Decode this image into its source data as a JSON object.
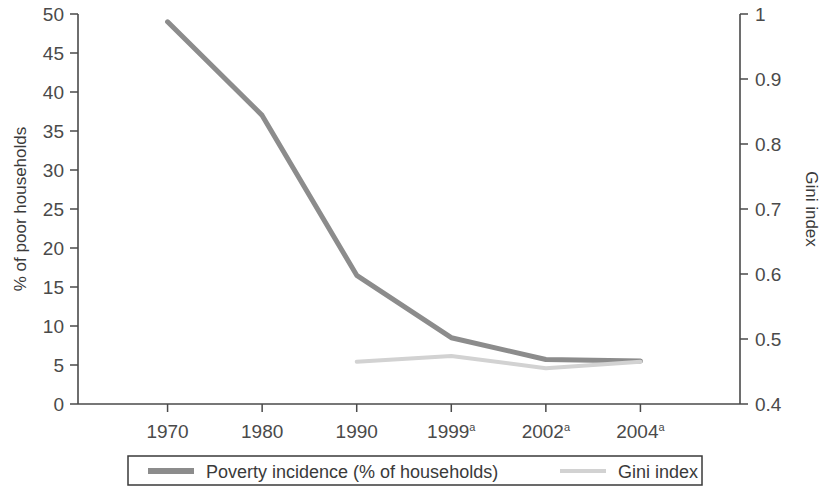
{
  "chart_data": {
    "type": "line",
    "title": "",
    "xlabel": "",
    "ylabel": "% of poor households",
    "y2label": "Gini index",
    "categories": [
      "1970",
      "1980",
      "1990",
      "1999a",
      "2002a",
      "2004a"
    ],
    "tick_labels": [
      {
        "text": "1970",
        "sup": ""
      },
      {
        "text": "1980",
        "sup": ""
      },
      {
        "text": "1990",
        "sup": ""
      },
      {
        "text": "1999",
        "sup": "a"
      },
      {
        "text": "2002",
        "sup": "a"
      },
      {
        "text": "2004",
        "sup": "a"
      }
    ],
    "ylim": [
      0,
      50
    ],
    "ylim_right": [
      0.4,
      1
    ],
    "yticks": [
      0,
      5,
      10,
      15,
      20,
      25,
      30,
      35,
      40,
      45,
      50
    ],
    "ytick_labels": [
      "0",
      "5",
      "10",
      "15",
      "20",
      "25",
      "30",
      "35",
      "40",
      "45",
      "50"
    ],
    "yticks_right": [
      0.4,
      0.5,
      0.6,
      0.7,
      0.8,
      0.9,
      1
    ],
    "ytick_labels_right": [
      "0.4",
      "0.5",
      "0.6",
      "0.7",
      "0.8",
      "0.9",
      "1"
    ],
    "grid": false,
    "legend_position": "bottom",
    "series": [
      {
        "name": "Poverty incidence (% of households)",
        "axis": "left",
        "color": "#8c8c8c",
        "line_width": 5,
        "x": [
          "1970",
          "1980",
          "1990",
          "1999a",
          "2002a",
          "2004a"
        ],
        "values": [
          49,
          37,
          16.5,
          8.5,
          5.7,
          5.5
        ]
      },
      {
        "name": "Gini index",
        "axis": "right",
        "color": "#d2d2d2",
        "line_width": 4,
        "x": [
          "1990",
          "1999a",
          "2002a",
          "2004a"
        ],
        "values": [
          0.465,
          0.474,
          0.455,
          0.465
        ]
      }
    ]
  },
  "legend": {
    "items": [
      {
        "label": "Poverty incidence (% of households)",
        "color": "#8c8c8c"
      },
      {
        "label": "Gini index",
        "color": "#d2d2d2"
      }
    ]
  },
  "colors": {
    "poverty_line": "#8c8c8c",
    "gini_line": "#d2d2d2",
    "axis": "#4a4a4a",
    "text": "#3a3a3a",
    "background": "#ffffff"
  }
}
